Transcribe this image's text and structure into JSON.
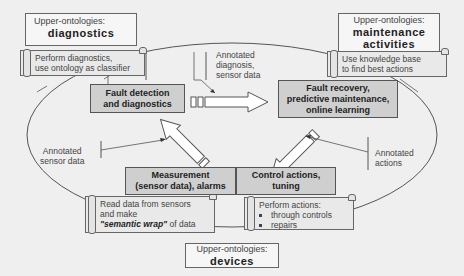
{
  "ontologies": {
    "diagnostics": {
      "label": "Upper-ontologies:",
      "title": "diagnostics"
    },
    "maintenance": {
      "label": "Upper-ontologies:",
      "title_line1": "maintenance",
      "title_line2": "activities"
    },
    "devices": {
      "label": "Upper-ontologies:",
      "title": "devices"
    }
  },
  "scrolls": {
    "diagnostics": {
      "line1": "Perform diagnostics,",
      "line2": "use ontology as classifier"
    },
    "maintenance": {
      "line1": "Use knowledge base",
      "line2": "to find best actions"
    },
    "sensors": {
      "line1": "Read data from sensors",
      "line2": "and make",
      "emphasis": "\"semantic wrap\"",
      "line3_rest": " of data"
    },
    "actions": {
      "line1": "Perform actions:",
      "bullets": [
        "through controls",
        "repairs"
      ]
    }
  },
  "processes": {
    "fault_detection": {
      "line1": "Fault detection",
      "line2": "and diagnostics"
    },
    "fault_recovery": {
      "line1": "Fault recovery,",
      "line2": "predictive maintenance,",
      "line3": "online learning"
    },
    "measurement": {
      "line1": "Measurement",
      "line2": "(sensor data), alarms"
    },
    "control": {
      "line1": "Control actions,",
      "line2": "tuning"
    }
  },
  "annotations": {
    "diagnosis": {
      "line1": "Annotated",
      "line2": "diagnosis,",
      "line3": "sensor data"
    },
    "sensor": {
      "line1": "Annotated",
      "line2": "sensor data"
    },
    "actions": {
      "line1": "Annotated",
      "line2": "actions"
    }
  },
  "colors": {
    "background": "#efefef",
    "process_fill": "#cfcfcf",
    "scroll_fill": "#e9e9e9",
    "stroke": "#555555"
  }
}
